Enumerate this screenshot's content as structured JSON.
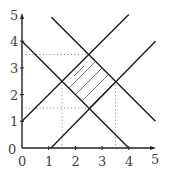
{
  "diagram": {
    "type": "linear-inequality-region",
    "x_axis": {
      "min": 0,
      "max": 5,
      "ticks": [
        "0",
        "1",
        "2",
        "3",
        "4",
        "5"
      ]
    },
    "y_axis": {
      "min": 0,
      "max": 5,
      "ticks": [
        "0",
        "1",
        "2",
        "3",
        "4",
        "5"
      ]
    },
    "lines": [
      {
        "name": "x+y=4",
        "from": [
          0,
          4
        ],
        "to": [
          4,
          0
        ]
      },
      {
        "name": "x+y=6",
        "from": [
          1.1,
          4.9
        ],
        "to": [
          5,
          1
        ]
      },
      {
        "name": "y=x+1",
        "from": [
          0,
          1
        ],
        "to": [
          4,
          5
        ]
      },
      {
        "name": "y=x-1",
        "from": [
          1,
          0
        ],
        "to": [
          5,
          4
        ]
      }
    ],
    "shaded_region": {
      "vertices": [
        [
          1.5,
          2.5
        ],
        [
          2.5,
          3.5
        ],
        [
          3.5,
          2.5
        ],
        [
          2.5,
          1.5
        ]
      ],
      "style": "hatched"
    },
    "guides": {
      "horizontal": [
        3.5,
        1.5
      ],
      "vertical": [
        1.5,
        3.5
      ]
    },
    "colors": {
      "line": "#222222",
      "guide": "#888888",
      "hatch": "#555555",
      "axis": "#222222"
    }
  }
}
